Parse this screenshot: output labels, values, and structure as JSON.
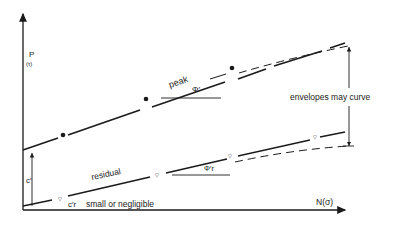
{
  "diagram": {
    "type": "strength-envelope",
    "y_axis": {
      "label": "P",
      "sublabel": "(τ)"
    },
    "x_axis": {
      "label": "N(σ)"
    },
    "lines": {
      "peak": {
        "label": "peak",
        "angle_label": "Φ′"
      },
      "residual": {
        "label": "residual",
        "angle_label": "Φ′r"
      }
    },
    "annotations": {
      "cohesion": "c′",
      "residual_cohesion": "c′r",
      "residual_cohesion_note": "small or negligible",
      "curve_note": "envelopes may curve"
    },
    "colors": {
      "ink": "#1a1a1a",
      "background": "#ffffff"
    }
  }
}
